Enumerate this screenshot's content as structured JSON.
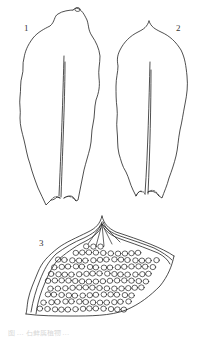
{
  "figure": {
    "panels": [
      {
        "id": "1",
        "label": "1",
        "description": "leaf outline with hair-point tip and single costa"
      },
      {
        "id": "2",
        "label": "2",
        "description": "leaf outline with short apiculate apex and single costa"
      },
      {
        "id": "3",
        "label": "3",
        "description": "leaf apex cells, rounded-hexagonal areolation with thickened margin"
      }
    ],
    "caption": "图 … 石藓属植物 …",
    "line_color": "#222222",
    "background": "#ffffff"
  }
}
